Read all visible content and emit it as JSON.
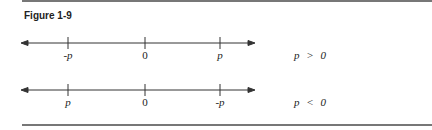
{
  "figure": {
    "title": "Figure 1-9"
  },
  "lines": [
    {
      "labels": [
        "-p",
        "0",
        "p"
      ],
      "condition": "p > 0"
    },
    {
      "labels": [
        "p",
        "0",
        "-p"
      ],
      "condition": "p < 0"
    }
  ],
  "colors": {
    "ink": "#222222",
    "rule": "#777777"
  }
}
